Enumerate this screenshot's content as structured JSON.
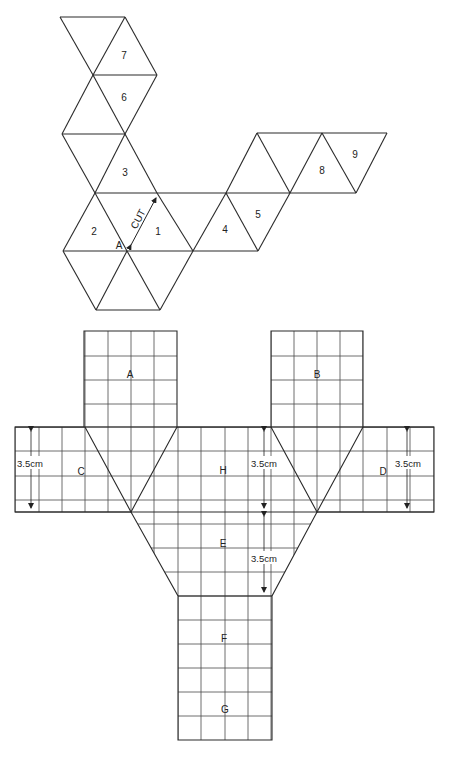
{
  "figure_top": {
    "title": "Icosahedron net (triangles)",
    "triangle_labels": {
      "t1": "1",
      "t2": "2",
      "t3": "3",
      "t4": "4",
      "t5": "5",
      "t6": "6",
      "t7": "7",
      "t8": "8",
      "t9": "9"
    },
    "cut_label": "CUT",
    "vertex_label": "A"
  },
  "figure_bottom": {
    "panel_labels": {
      "A": "A",
      "B": "B",
      "C": "C",
      "D": "D",
      "E": "E",
      "F": "F",
      "G": "G",
      "H": "H"
    },
    "dimensions": {
      "left_band": "3.5cm",
      "center_band": "3.5cm",
      "right_band": "3.5cm",
      "center_trapezoid": "3.5cm"
    }
  },
  "colors": {
    "line": "#2a2a2a",
    "background": "#ffffff"
  }
}
